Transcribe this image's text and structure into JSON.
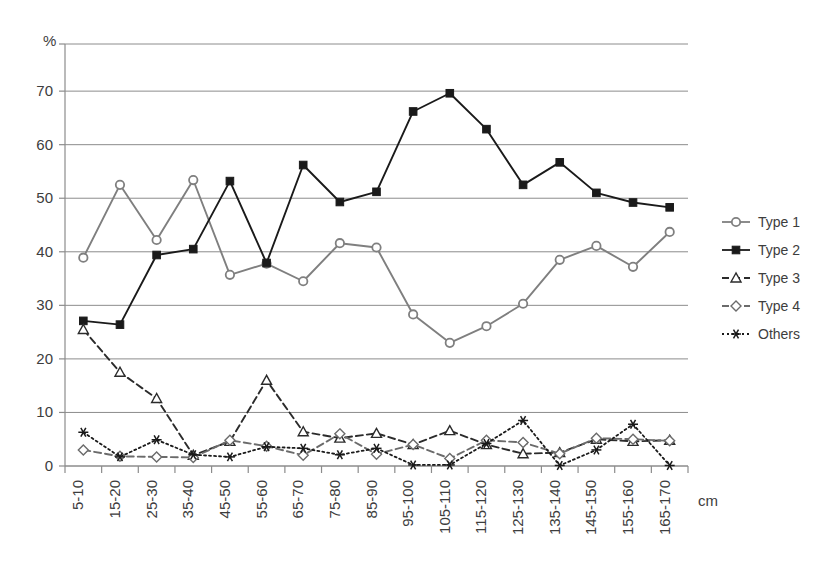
{
  "chart_data": {
    "type": "line",
    "title": "",
    "xlabel": "cm",
    "ylabel": "%",
    "ylim": [
      0,
      78.8
    ],
    "yticks": [
      0,
      10,
      20,
      30,
      40,
      50,
      60,
      70
    ],
    "grid": true,
    "legend_position": "right",
    "categories": [
      "5-10",
      "15-20",
      "25-30",
      "35-40",
      "45-50",
      "55-60",
      "65-70",
      "75-80",
      "85-90",
      "95-100",
      "105-110",
      "115-120",
      "125-130",
      "135-140",
      "145-150",
      "155-160",
      "165-170"
    ],
    "series": [
      {
        "name": "Type 1",
        "marker": "open-circle",
        "linestyle": "solid",
        "color": "#7f7f7f",
        "values": [
          38.9,
          52.5,
          42.2,
          53.4,
          35.7,
          37.8,
          34.5,
          41.6,
          40.8,
          28.3,
          23.0,
          26.1,
          30.3,
          38.5,
          41.1,
          37.2,
          43.7
        ]
      },
      {
        "name": "Type 2",
        "marker": "filled-square",
        "linestyle": "solid",
        "color": "#1a1a1a",
        "values": [
          27.1,
          26.4,
          39.4,
          40.5,
          53.2,
          37.9,
          56.2,
          49.3,
          51.2,
          66.2,
          69.6,
          62.9,
          52.5,
          56.7,
          51.0,
          49.2,
          48.3
        ]
      },
      {
        "name": "Type 3",
        "marker": "open-triangle",
        "linestyle": "dashed",
        "color": "#2b2b2b",
        "values": [
          25.5,
          17.5,
          12.6,
          2.0,
          4.6,
          16.0,
          6.4,
          5.2,
          6.1,
          4.0,
          6.6,
          4.0,
          2.3,
          2.5,
          5.0,
          4.6,
          4.8
        ]
      },
      {
        "name": "Type 4",
        "marker": "open-diamond",
        "linestyle": "dashed",
        "color": "#6b6b6b",
        "values": [
          3.0,
          1.8,
          1.7,
          1.6,
          4.8,
          3.7,
          2.0,
          6.0,
          2.2,
          4.0,
          1.4,
          4.8,
          4.4,
          2.3,
          5.2,
          5.0,
          4.7
        ]
      },
      {
        "name": "Others",
        "marker": "asterisk",
        "linestyle": "dotted",
        "color": "#1a1a1a",
        "values": [
          6.3,
          1.7,
          4.9,
          2.1,
          1.7,
          3.6,
          3.3,
          2.1,
          3.3,
          0.2,
          0.2,
          4.2,
          8.5,
          0.1,
          3.0,
          7.8,
          0.1
        ]
      }
    ]
  },
  "axis": {
    "y_unit": "%",
    "x_unit": "cm"
  },
  "legend": {
    "items": [
      {
        "label": "Type 1"
      },
      {
        "label": "Type 2"
      },
      {
        "label": "Type 3"
      },
      {
        "label": "Type 4"
      },
      {
        "label": "Others"
      }
    ]
  }
}
